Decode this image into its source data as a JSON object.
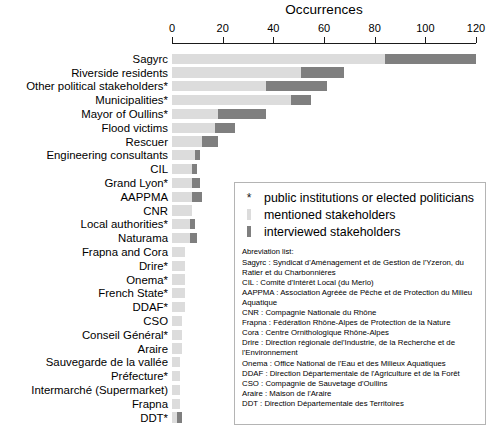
{
  "chart_data": {
    "type": "bar",
    "orientation": "horizontal",
    "stacked": true,
    "title": "Occurrences",
    "xlabel": "Occurrences",
    "ylabel": "",
    "xlim": [
      0,
      120
    ],
    "xticks": [
      0,
      20,
      40,
      60,
      80,
      100,
      120
    ],
    "grid": false,
    "legend_position": "center-right",
    "categories": [
      "Sagyrc",
      "Riverside residents",
      "Other political stakeholders*",
      "Municipalities*",
      "Mayor of Oullins*",
      "Flood victims",
      "Rescuer",
      "Engineering consultants",
      "CIL",
      "Grand Lyon*",
      "AAPPMA",
      "CNR",
      "Local authorities*",
      "Naturama",
      "Frapna and Cora",
      "Drire*",
      "Onema*",
      "French State*",
      "DDAF*",
      "CSO",
      "Conseil Général*",
      "Araire",
      "Sauvegarde de la vallée",
      "Préfecture*",
      "Intermarché (Supermarket)",
      "Frapna",
      "DDT*"
    ],
    "series": [
      {
        "name": "mentioned stakeholders",
        "color": "#dcdcdc",
        "values": [
          84,
          51,
          37,
          47,
          18,
          17,
          12,
          9,
          8,
          8,
          8,
          8,
          7,
          7,
          5,
          5,
          5,
          5,
          5,
          4,
          4,
          4,
          3,
          3,
          3,
          3,
          2
        ]
      },
      {
        "name": "interviewed stakeholders",
        "color": "#7f7f7f",
        "values": [
          36,
          17,
          24,
          8,
          19,
          8,
          6,
          2,
          2,
          3,
          4,
          0,
          2,
          3,
          0,
          0,
          0,
          0,
          0,
          0,
          0,
          0,
          0,
          0,
          0,
          0,
          2
        ]
      }
    ],
    "totals": [
      120,
      68,
      61,
      55,
      37,
      25,
      18,
      11,
      10,
      11,
      12,
      8,
      9,
      10,
      5,
      5,
      5,
      5,
      5,
      4,
      4,
      4,
      3,
      3,
      3,
      3,
      4
    ]
  },
  "legend": {
    "items": [
      {
        "marker": "star-marker",
        "label": "public institutions or elected politicians"
      },
      {
        "marker": "light-gray-bar",
        "label": "mentioned stakeholders"
      },
      {
        "marker": "dark-gray-bar",
        "label": "interviewed stakeholders"
      }
    ],
    "abbreviation_title": "Abreviation list:",
    "abbreviations": [
      "Sagyrc : Syndicat d'Aménagement et de Gestion de l'Yzeron, du Ratier et du Charbonnières",
      "CIL : Comité d'Intérêt Local (du Merlo)",
      "AAPPMA : Association Agréée de Pêche et de Protection du Milieu Aquatique",
      "CNR : Compagnie Nationale du Rhône",
      "Frapna : Fédération Rhône-Alpes de Protection de la Nature",
      "Cora : Centre Ornithologique Rhône-Alpes",
      "Drire : Direction régionale del'Industrie, de la Recherche et de l'Environnement",
      "Onema : Office National de l'Eau et des Milieux Aquatiques",
      "DDAF : Direction Départementale de l'Agriculture et de la Forêt",
      "CSO : Compagnie de Sauvetage d'Oullins",
      "Araire : Maison de l'Araire",
      "DDT : Direction Départementale des Territoires"
    ]
  },
  "colors": {
    "mentioned": "#dcdcdc",
    "interviewed": "#7f7f7f",
    "axis": "#1a1a1a",
    "legend_border": "#b4b4b4"
  }
}
